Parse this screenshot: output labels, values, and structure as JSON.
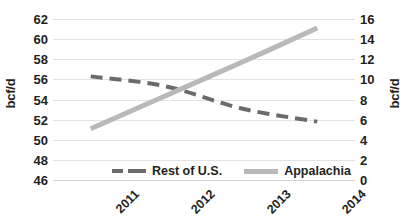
{
  "chart_data": {
    "type": "line",
    "title": "",
    "subtitle": "",
    "xlabel": "",
    "ylabel": "bcf/d",
    "y2label": "bcf/d",
    "categories": [
      "2011",
      "2012",
      "2013",
      "2014"
    ],
    "grid": true,
    "legend_position": "bottom",
    "ylim": [
      46,
      62
    ],
    "y_ticks": [
      46,
      48,
      50,
      52,
      54,
      56,
      58,
      60,
      62
    ],
    "y2lim": [
      0,
      16
    ],
    "y2_ticks": [
      0,
      2,
      4,
      6,
      8,
      10,
      12,
      14,
      16
    ],
    "series": [
      {
        "name": "Rest of U.S.",
        "axis": "left",
        "style": "dashed",
        "color": "#6b6b6b",
        "values": [
          56.3,
          55.3,
          53.1,
          51.8
        ]
      },
      {
        "name": "Appalachia",
        "axis": "right",
        "style": "solid",
        "color": "#b9b9b9",
        "values": [
          5.1,
          8.4,
          11.7,
          15.1
        ]
      }
    ],
    "annotations": []
  },
  "axes": {
    "left_title": "bcf/d",
    "right_title": "bcf/d",
    "left_ticks": [
      "62",
      "60",
      "58",
      "56",
      "54",
      "52",
      "50",
      "48",
      "46"
    ],
    "right_ticks": [
      "16",
      "14",
      "12",
      "10",
      "8",
      "6",
      "4",
      "2",
      "0"
    ],
    "x_ticks": [
      "2011",
      "2012",
      "2013",
      "2014"
    ]
  },
  "legend": {
    "items": [
      {
        "label": "Rest of U.S.",
        "swatch": "dashed-line-swatch"
      },
      {
        "label": "Appalachia",
        "swatch": "solid-line-swatch"
      }
    ]
  },
  "caption": {
    "text": ""
  }
}
